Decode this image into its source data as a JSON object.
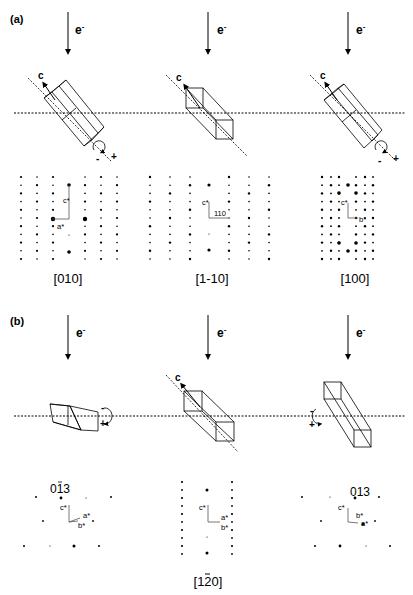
{
  "figure": {
    "panels": [
      {
        "label": "(a)",
        "columns": [
          {
            "beam_label": "e",
            "beam_superscript": "-",
            "axis_label": "c",
            "rotation": {
              "minus": "-",
              "plus": "+"
            },
            "vectors": [
              "c*",
              "a*"
            ],
            "zone_axis": "[010]"
          },
          {
            "beam_label": "e",
            "beam_superscript": "-",
            "axis_label": "c",
            "vectors": [
              "c*",
              "110"
            ],
            "zone_axis": "[1-10]"
          },
          {
            "beam_label": "e",
            "beam_superscript": "-",
            "axis_label": "c",
            "rotation": {
              "minus": "-",
              "plus": "+"
            },
            "vectors": [
              "c*",
              "b*"
            ],
            "zone_axis": "[100]"
          }
        ]
      },
      {
        "label": "(b)",
        "columns": [
          {
            "beam_label": "e",
            "beam_superscript": "-",
            "rotation": {
              "minus": "-",
              "plus": "+"
            },
            "spot_label": "01̄ 3",
            "spot_label_main": "013",
            "spot_label_bar_over": "1",
            "vectors": [
              "c*",
              "a*",
              "b*"
            ]
          },
          {
            "beam_label": "e",
            "beam_superscript": "-",
            "axis_label": "c",
            "vectors": [
              "c*",
              "a*",
              "b*"
            ],
            "zone_axis": "[120]",
            "zone_axis_bar_over": "1"
          },
          {
            "beam_label": "e",
            "beam_superscript": "-",
            "rotation": {
              "minus": "-",
              "plus": "+"
            },
            "spot_label": "013",
            "vectors": [
              "c*",
              "b*",
              "a*"
            ]
          }
        ]
      }
    ]
  }
}
